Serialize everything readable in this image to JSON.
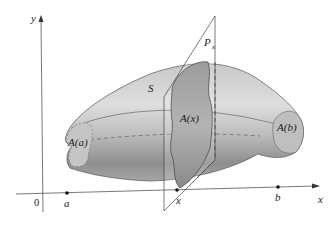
{
  "figure": {
    "axes": {
      "x_label": "x",
      "y_label": "y",
      "origin_label": "0"
    },
    "axis_points": [
      {
        "label": "a"
      },
      {
        "label": "x"
      },
      {
        "label": "b"
      }
    ],
    "solid_label": "S",
    "plane_label": "P",
    "plane_subscript": "x",
    "cross_sections": {
      "left": "A(a)",
      "middle": "A(x)",
      "right": "A(b)"
    },
    "colors": {
      "solid_light": "#d4d4d4",
      "solid_dark": "#8f8f8f",
      "section_fill": "#a8a8a8",
      "outline": "#444444"
    }
  }
}
